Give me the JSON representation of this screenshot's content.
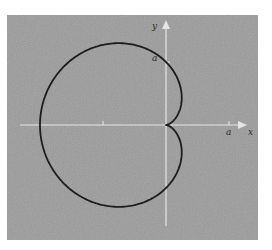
{
  "figure": {
    "colors": {
      "background": "#ffffff",
      "panel": "#9b9b9b",
      "axis": "#e6e6e6",
      "curve": "#1c1c1c",
      "label": "#2a2a2a"
    },
    "panel": {
      "x": 7,
      "y": 15,
      "width": 251,
      "height": 225
    },
    "origin": {
      "x": 166,
      "y": 125
    },
    "scale_a_px": 63,
    "x_axis": {
      "x_start": 20,
      "x_end": 247,
      "label": "x"
    },
    "y_axis": {
      "y_start": 226,
      "y_end": 20,
      "label": "y"
    },
    "ticks": [
      {
        "axis": "x",
        "value": "-a",
        "label": ""
      },
      {
        "axis": "x",
        "value": "a",
        "label": "a"
      },
      {
        "axis": "y",
        "value": "a",
        "label": "a"
      }
    ],
    "labels": {
      "x_axis": "x",
      "y_axis": "y",
      "a_on_x": "a",
      "a_on_y": "a"
    },
    "curve": {
      "type": "cardioid",
      "equation": "r = a(1 - cos θ)",
      "stroke_width": 1.8
    }
  }
}
